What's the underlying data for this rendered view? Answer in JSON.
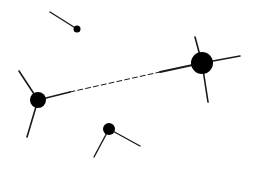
{
  "diagram": {
    "width": 257,
    "height": 172,
    "background": "#ffffff",
    "stroke_color": "#1a1a1a",
    "node_color": "#000000",
    "nodes": [
      {
        "id": "node-top-small",
        "cx": 77,
        "cy": 29,
        "r": 3.5
      },
      {
        "id": "node-right-large",
        "cx": 202,
        "cy": 63,
        "r": 11
      },
      {
        "id": "node-left-medium",
        "cx": 38,
        "cy": 100,
        "r": 8
      },
      {
        "id": "node-bottom-small",
        "cx": 109,
        "cy": 129,
        "r": 6
      }
    ],
    "edges": [
      {
        "id": "stub-top-small",
        "x1": 50,
        "y1": 12,
        "x2": 77,
        "y2": 29,
        "style": "solid",
        "width": 1.4
      },
      {
        "id": "stub-right-up",
        "x1": 195,
        "y1": 37,
        "x2": 202,
        "y2": 63,
        "style": "solid",
        "width": 1.6
      },
      {
        "id": "stub-right-down",
        "x1": 202,
        "y1": 63,
        "x2": 208,
        "y2": 102,
        "style": "solid",
        "width": 1.6
      },
      {
        "id": "stub-right-right",
        "x1": 202,
        "y1": 63,
        "x2": 240,
        "y2": 56,
        "style": "solid",
        "width": 1.6
      },
      {
        "id": "link-right-solid",
        "x1": 160,
        "y1": 72,
        "x2": 202,
        "y2": 63,
        "style": "solid",
        "width": 1.8
      },
      {
        "id": "link-dashed",
        "x1": 70,
        "y1": 92,
        "x2": 160,
        "y2": 72,
        "style": "dashed",
        "width": 1.0
      },
      {
        "id": "link-left-solid",
        "x1": 38,
        "y1": 100,
        "x2": 70,
        "y2": 92,
        "style": "solid",
        "width": 1.8
      },
      {
        "id": "stub-left-up",
        "x1": 19,
        "y1": 71,
        "x2": 38,
        "y2": 100,
        "style": "solid",
        "width": 1.6
      },
      {
        "id": "stub-left-down",
        "x1": 38,
        "y1": 100,
        "x2": 27,
        "y2": 137,
        "style": "solid",
        "width": 1.6
      },
      {
        "id": "stub-bottom-left",
        "x1": 109,
        "y1": 129,
        "x2": 94,
        "y2": 157,
        "style": "solid",
        "width": 1.4
      },
      {
        "id": "stub-bottom-right",
        "x1": 109,
        "y1": 129,
        "x2": 140,
        "y2": 146,
        "style": "solid",
        "width": 1.4
      }
    ]
  }
}
